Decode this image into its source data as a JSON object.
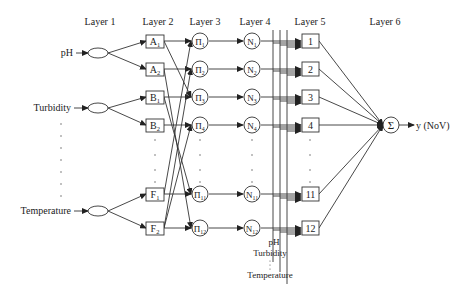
{
  "layers": [
    "Layer 1",
    "Layer 2",
    "Layer 3",
    "Layer 4",
    "Layer 5",
    "Layer 6"
  ],
  "inputs": [
    "pH",
    "Turbidity",
    "Temperature"
  ],
  "layer2_nodes": [
    {
      "letter": "A",
      "sub": "1"
    },
    {
      "letter": "A",
      "sub": "2"
    },
    {
      "letter": "B",
      "sub": "1"
    },
    {
      "letter": "B",
      "sub": "2"
    },
    {
      "letter": "F",
      "sub": "1"
    },
    {
      "letter": "F",
      "sub": "2"
    }
  ],
  "layer3_nodes": [
    {
      "letter": "Π",
      "sub": "1"
    },
    {
      "letter": "Π",
      "sub": "2"
    },
    {
      "letter": "Π",
      "sub": "3"
    },
    {
      "letter": "Π",
      "sub": "4"
    },
    {
      "letter": "Π",
      "sub": "11"
    },
    {
      "letter": "Π",
      "sub": "12"
    }
  ],
  "layer4_nodes": [
    {
      "letter": "N",
      "sub": "1"
    },
    {
      "letter": "N",
      "sub": "2"
    },
    {
      "letter": "N",
      "sub": "3"
    },
    {
      "letter": "N",
      "sub": "4"
    },
    {
      "letter": "N",
      "sub": "11"
    },
    {
      "letter": "N",
      "sub": "12"
    }
  ],
  "layer5_nodes": [
    "1",
    "2",
    "3",
    "4",
    "11",
    "12"
  ],
  "layer6_node": "Σ",
  "output_label": "y (NoV)",
  "bus_labels": [
    "pH",
    "Turbidity",
    "Temperature"
  ],
  "layer2_to_layer3": [
    [
      0,
      0
    ],
    [
      0,
      2
    ],
    [
      1,
      1
    ],
    [
      1,
      5
    ],
    [
      2,
      2
    ],
    [
      2,
      4
    ],
    [
      3,
      3
    ],
    [
      4,
      4
    ],
    [
      4,
      0
    ],
    [
      5,
      5
    ],
    [
      5,
      1
    ],
    [
      5,
      3
    ]
  ]
}
